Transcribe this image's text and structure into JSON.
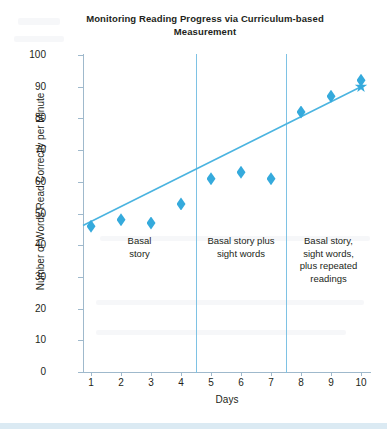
{
  "chart_data": {
    "type": "scatter",
    "title": "Monitoring Reading Progress via Curriculum-based Measurement",
    "xlabel": "Days",
    "ylabel": "Number of Words Read Correctly per Minute",
    "x": [
      1,
      2,
      3,
      4,
      5,
      6,
      7,
      8,
      9,
      10
    ],
    "categories": [
      "1",
      "2",
      "3",
      "4",
      "5",
      "6",
      "7",
      "8",
      "9",
      "10"
    ],
    "values": [
      46,
      48,
      47,
      53,
      61,
      63,
      61,
      82,
      87,
      92
    ],
    "goal_marker": {
      "x": 10,
      "y": 90,
      "shape": "star"
    },
    "series": [
      {
        "name": "Words read correctly per minute",
        "marker": "diamond",
        "color": "#35aadc",
        "values": [
          46,
          48,
          47,
          53,
          61,
          63,
          61,
          82,
          87,
          92
        ]
      }
    ],
    "trend_line": {
      "name": "Trend line",
      "color": "#4bb4e0",
      "x_start": 1,
      "y_start": 47,
      "x_end": 10,
      "y_end": 90
    },
    "xlim": [
      0.4,
      10.4
    ],
    "ylim": [
      0,
      100
    ],
    "ytick_labels": [
      "100",
      "90",
      "80",
      "70",
      "60",
      "50",
      "40",
      "30",
      "20",
      "10",
      "0"
    ],
    "ytick_values": [
      100,
      90,
      80,
      70,
      60,
      50,
      40,
      30,
      20,
      10,
      0
    ],
    "grid": false,
    "legend": "none",
    "phases": [
      {
        "label": "Basal\nstory",
        "line1": "Basal",
        "line2": "story",
        "line3": "",
        "line4": "",
        "start": 1,
        "end": 4
      },
      {
        "label": "Basal story plus sight words",
        "line1": "Basal story plus",
        "line2": "sight words",
        "line3": "",
        "line4": "",
        "start": 5,
        "end": 7
      },
      {
        "label": "Basal story, sight words, plus repeated readings",
        "line1": "Basal story,",
        "line2": "sight words,",
        "line3": "plus repeated",
        "line4": "readings",
        "start": 8,
        "end": 10
      }
    ],
    "phase_divider_x": [
      4.5,
      7.5
    ]
  },
  "colors": {
    "marker": "#35aadc",
    "trend": "#4bb4e0",
    "divider": "#7ec2e4",
    "axis": "#9fb9cc",
    "text": "#231f20"
  }
}
